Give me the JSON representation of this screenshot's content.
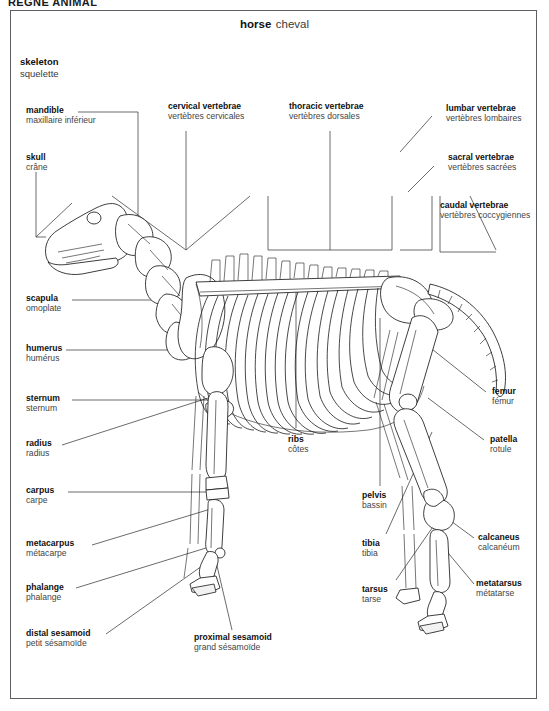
{
  "header": {
    "text": "RÈGNE ANIMAL"
  },
  "title": {
    "en": "horse",
    "fr": "cheval"
  },
  "subtitle": {
    "en": "skeleton",
    "fr": "squelette"
  },
  "labels": [
    {
      "key": "mandible",
      "en": "mandible",
      "fr": "maxillaire inférieur"
    },
    {
      "key": "skull",
      "en": "skull",
      "fr": "crâne"
    },
    {
      "key": "cervical",
      "en": "cervical vertebrae",
      "fr": "vertèbres cervicales"
    },
    {
      "key": "thoracic",
      "en": "thoracic vertebrae",
      "fr": "vertèbres dorsales"
    },
    {
      "key": "lumbar",
      "en": "lumbar vertebrae",
      "fr": "vertèbres lombaires"
    },
    {
      "key": "sacral",
      "en": "sacral vertebrae",
      "fr": "vertèbres sacrées"
    },
    {
      "key": "caudal",
      "en": "caudal vertebrae",
      "fr": "vertèbres coccygiennes"
    },
    {
      "key": "scapula",
      "en": "scapula",
      "fr": "omoplate"
    },
    {
      "key": "humerus",
      "en": "humerus",
      "fr": "humérus"
    },
    {
      "key": "sternum",
      "en": "sternum",
      "fr": "sternum"
    },
    {
      "key": "radius",
      "en": "radius",
      "fr": "radius"
    },
    {
      "key": "carpus",
      "en": "carpus",
      "fr": "carpe"
    },
    {
      "key": "metacarpus",
      "en": "metacarpus",
      "fr": "métacarpe"
    },
    {
      "key": "phalange",
      "en": "phalange",
      "fr": "phalange"
    },
    {
      "key": "distal_sesamoid",
      "en": "distal sesamoid",
      "fr": "petit sésamoïde"
    },
    {
      "key": "proximal_sesamoid",
      "en": "proximal sesamoid",
      "fr": "grand sésamoïde"
    },
    {
      "key": "ribs",
      "en": "ribs",
      "fr": "côtes"
    },
    {
      "key": "pelvis",
      "en": "pelvis",
      "fr": "bassin"
    },
    {
      "key": "tibia",
      "en": "tibia",
      "fr": "tibia"
    },
    {
      "key": "tarsus",
      "en": "tarsus",
      "fr": "tarse"
    },
    {
      "key": "femur",
      "en": "femur",
      "fr": "fémur"
    },
    {
      "key": "patella",
      "en": "patella",
      "fr": "rotule"
    },
    {
      "key": "calcaneus",
      "en": "calcaneus",
      "fr": "calcanéum"
    },
    {
      "key": "metatarsus",
      "en": "metatarsus",
      "fr": "métatarse"
    }
  ],
  "colors": {
    "ink": "#1b1b1b",
    "leader": "#2b2b2b",
    "border": "#5b5f63",
    "paper": "#ffffff"
  }
}
